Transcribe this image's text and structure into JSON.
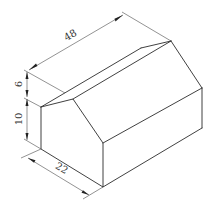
{
  "figure": {
    "type": "isometric-drawing",
    "stroke_color": "#2b2b2b",
    "background": "#ffffff"
  },
  "dimensions": {
    "length": {
      "label": "48",
      "value": 48
    },
    "depth": {
      "label": "22",
      "value": 22
    },
    "roof_height": {
      "label": "6",
      "value": 6
    },
    "wall_height": {
      "label": "10",
      "value": 10
    }
  }
}
